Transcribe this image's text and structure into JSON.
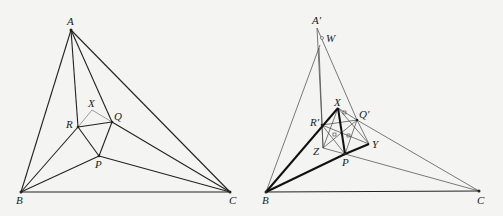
{
  "figures": [
    {
      "id": "left",
      "labels": {
        "A": "A",
        "B": "B",
        "C": "C",
        "P": "P",
        "Q": "Q",
        "R": "R",
        "X": "X"
      },
      "points": {
        "A": [
          71,
          30
        ],
        "B": [
          21,
          192
        ],
        "C": [
          230,
          192
        ],
        "R": [
          78,
          127
        ],
        "Q": [
          112,
          122
        ],
        "P": [
          99,
          156
        ],
        "X": [
          92,
          110
        ]
      }
    },
    {
      "id": "right",
      "labels": {
        "A": "A′",
        "W": "W",
        "B": "B",
        "C": "C",
        "P": "P",
        "Q": "Q′",
        "R": "R′",
        "X": "X",
        "Y": "Y",
        "Z": "Z"
      },
      "points": {
        "A": [
          317,
          28
        ],
        "W": [
          322,
          38
        ],
        "B": [
          266,
          192
        ],
        "C": [
          479,
          191
        ],
        "X": [
          338,
          108
        ],
        "Q": [
          357,
          120
        ],
        "R": [
          322,
          125
        ],
        "Z": [
          323,
          148
        ],
        "Y": [
          369,
          144
        ],
        "P": [
          345,
          154
        ]
      }
    }
  ],
  "colors": {
    "line": "#222222",
    "thin": "#555555",
    "background": "#f4f4f2"
  }
}
